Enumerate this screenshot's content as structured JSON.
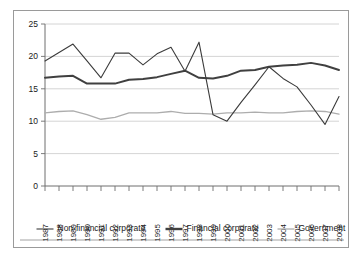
{
  "chart_data": {
    "type": "line",
    "title": "",
    "subtitle": "",
    "xlabel": "",
    "ylabel": "",
    "xlim": [
      1987,
      2008
    ],
    "ylim": [
      0,
      25
    ],
    "ytick_values": [
      0,
      5,
      10,
      15,
      20,
      25
    ],
    "ytick_labels": [
      "0",
      "5",
      "10",
      "15",
      "20",
      "25"
    ],
    "grid": "horizontal",
    "legend_position": "bottom",
    "categories": [
      "1987",
      "1988",
      "1989",
      "1990",
      "1991",
      "1992",
      "1993",
      "1994",
      "1995",
      "1996",
      "1997",
      "1998",
      "1999",
      "2000",
      "2001",
      "2002",
      "2003",
      "2004",
      "2005",
      "2006",
      "2007",
      "2008"
    ],
    "series": [
      {
        "name": "Non-financial corporate",
        "color": "#3b3b3b",
        "width": 1.1,
        "values": [
          19.3,
          20.6,
          21.9,
          19.3,
          16.7,
          20.5,
          20.5,
          18.7,
          20.4,
          21.4,
          17.7,
          22.2,
          11.0,
          10.0,
          12.9,
          15.6,
          18.4,
          16.6,
          15.3,
          12.5,
          9.5,
          13.8
        ]
      },
      {
        "name": "Financial corporate",
        "color": "#404040",
        "width": 2.0,
        "values": [
          16.7,
          16.9,
          17.0,
          15.8,
          15.8,
          15.8,
          16.4,
          16.5,
          16.8,
          17.3,
          17.8,
          16.7,
          16.6,
          17.0,
          17.8,
          17.9,
          18.4,
          18.6,
          18.7,
          19.0,
          18.6,
          17.9
        ]
      },
      {
        "name": "Government",
        "color": "#adadad",
        "width": 1.3,
        "values": [
          11.3,
          11.5,
          11.6,
          11.0,
          10.3,
          10.6,
          11.3,
          11.3,
          11.3,
          11.5,
          11.2,
          11.2,
          11.1,
          11.3,
          11.3,
          11.4,
          11.3,
          11.3,
          11.5,
          11.6,
          11.5,
          11.1
        ]
      }
    ]
  },
  "legend": {
    "items": [
      {
        "label": "Non-financial corporate",
        "color": "#3b3b3b",
        "width": 1.1
      },
      {
        "label": "Financial corporate",
        "color": "#404040",
        "width": 2.4
      },
      {
        "label": "Government",
        "color": "#adadad",
        "width": 1.3
      }
    ]
  }
}
